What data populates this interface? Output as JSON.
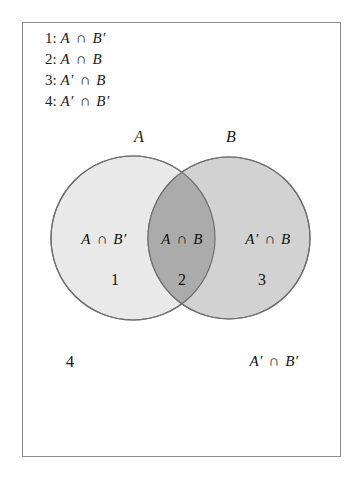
{
  "figure": {
    "type": "venn-diagram",
    "sets": [
      "A",
      "B"
    ],
    "border_color": "#8b8b8b",
    "background_color": "#ffffff"
  },
  "legend": {
    "items": [
      {
        "index": "1:",
        "expression": "A ∩ B′",
        "left": "A",
        "operator": "∩",
        "right": "B′"
      },
      {
        "index": "2:",
        "expression": "A ∩ B",
        "left": "A",
        "operator": "∩",
        "right": "B"
      },
      {
        "index": "3:",
        "expression": "A′ ∩ B",
        "left": "A′",
        "operator": "∩",
        "right": "B"
      },
      {
        "index": "4:",
        "expression": "A′ ∩ B′",
        "left": "A′",
        "operator": "∩",
        "right": "B′"
      }
    ]
  },
  "set_labels": {
    "a": "A",
    "b": "B"
  },
  "regions": [
    {
      "number": "1",
      "expression": "A ∩ B′",
      "left": "A",
      "operator": "∩",
      "right": "B′",
      "fill": "#e9e9e9",
      "description": "A only"
    },
    {
      "number": "2",
      "expression": "A ∩ B",
      "left": "A",
      "operator": "∩",
      "right": "B",
      "fill": "#ababab",
      "description": "intersection of A and B"
    },
    {
      "number": "3",
      "expression": "A′ ∩ B",
      "left": "A′",
      "operator": "∩",
      "right": "B",
      "fill": "#d2d2d2",
      "description": "B only"
    },
    {
      "number": "4",
      "expression": "A′ ∩ B′",
      "left": "A′",
      "operator": "∩",
      "right": "B′",
      "fill": "#ffffff",
      "description": "outside both A and B"
    }
  ],
  "colors": {
    "circle_a_fill": "#e9e9e9",
    "circle_b_fill": "#d2d2d2",
    "overlap_fill": "#ababab",
    "circle_stroke": "#6e6e6e",
    "frame_stroke": "#8b8b8b",
    "text": "#111111"
  }
}
